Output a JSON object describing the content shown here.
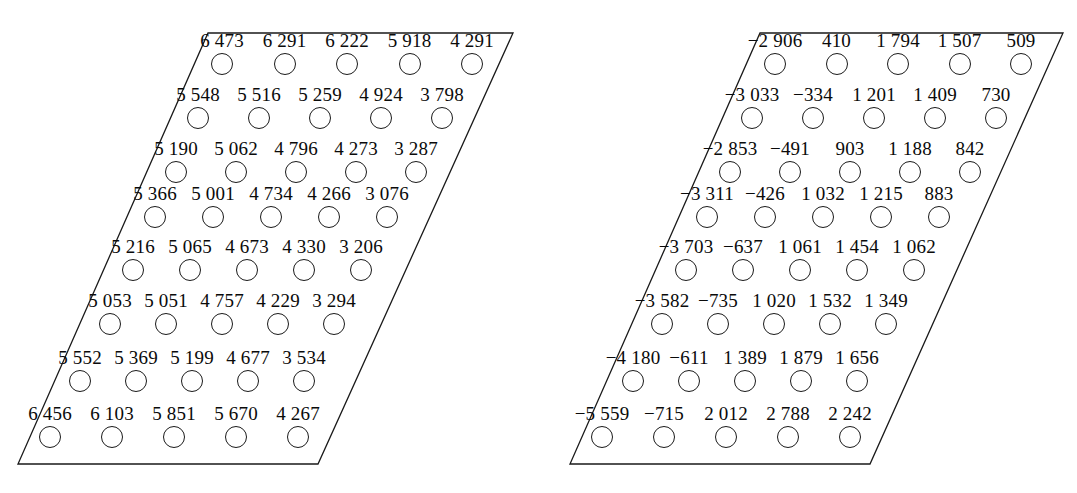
{
  "figure": {
    "type": "two-panel-diagram",
    "stroke_color": "#1a1a1a",
    "text_color": "#0a0a0a",
    "background_color": "#ffffff",
    "circle_radius": 11,
    "rows": 8,
    "cols": 5
  },
  "panels": [
    {
      "name": "left-panel",
      "shape": {
        "top_left": [
          208,
          33
        ],
        "top_right": [
          513,
          33
        ],
        "bottom_right": [
          318,
          464
        ],
        "bottom_left": [
          18,
          464
        ]
      },
      "row_y": [
        64,
        118,
        172,
        217,
        270,
        324,
        381,
        437
      ],
      "row_first_x": [
        222,
        198,
        176,
        155,
        133,
        110,
        80,
        50
      ],
      "col_step": [
        62.5,
        61,
        60,
        58,
        57,
        56,
        56,
        62
      ],
      "values": [
        [
          "6 473",
          "6 291",
          "6 222",
          "5 918",
          "4 291"
        ],
        [
          "5 548",
          "5 516",
          "5 259",
          "4 924",
          "3 798"
        ],
        [
          "5 190",
          "5 062",
          "4 796",
          "4 273",
          "3 287"
        ],
        [
          "5 366",
          "5 001",
          "4 734",
          "4 266",
          "3 076"
        ],
        [
          "5 216",
          "5 065",
          "4 673",
          "4 330",
          "3 206"
        ],
        [
          "5 053",
          "5 051",
          "4 757",
          "4 229",
          "3 294"
        ],
        [
          "5 552",
          "5 369",
          "5 199",
          "4 677",
          "3 534"
        ],
        [
          "6 456",
          "6 103",
          "5 851",
          "5 670",
          "4 267"
        ]
      ]
    },
    {
      "name": "right-panel",
      "shape": {
        "top_left": [
          760,
          33
        ],
        "top_right": [
          1063,
          33
        ],
        "bottom_right": [
          870,
          464
        ],
        "bottom_left": [
          570,
          464
        ]
      },
      "row_y": [
        64,
        118,
        172,
        217,
        270,
        324,
        381,
        437
      ],
      "row_first_x": [
        775,
        752,
        730,
        707,
        686,
        662,
        633,
        602
      ],
      "col_step": [
        61.5,
        61,
        60,
        58,
        57,
        56,
        56,
        62
      ],
      "values": [
        [
          "−2 906",
          "410",
          "1 794",
          "1 507",
          "509"
        ],
        [
          "−3 033",
          "−334",
          "1 201",
          "1 409",
          "730"
        ],
        [
          "−2 853",
          "−491",
          "903",
          "1 188",
          "842"
        ],
        [
          "−3 311",
          "−426",
          "1 032",
          "1 215",
          "883"
        ],
        [
          "−3 703",
          "−637",
          "1 061",
          "1 454",
          "1 062"
        ],
        [
          "−3 582",
          "−735",
          "1 020",
          "1 532",
          "1 349"
        ],
        [
          "−4 180",
          "−611",
          "1 389",
          "1 879",
          "1 656"
        ],
        [
          "−5 559",
          "−715",
          "2 012",
          "2 788",
          "2 242"
        ]
      ]
    }
  ]
}
